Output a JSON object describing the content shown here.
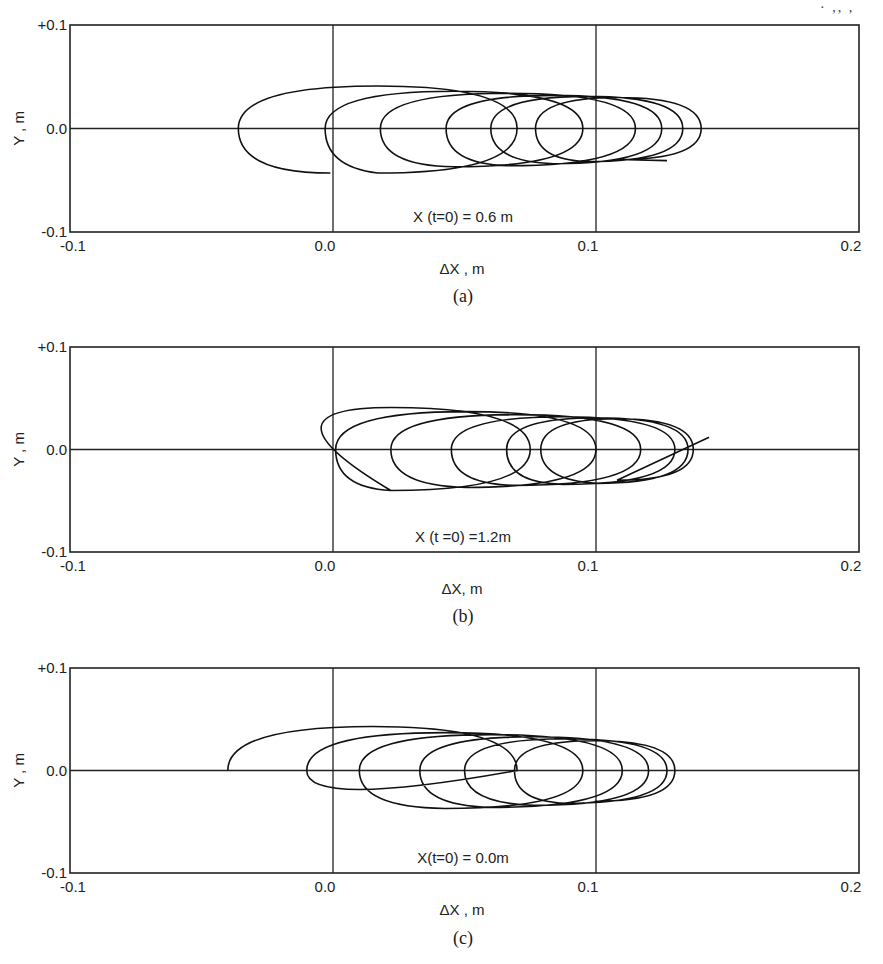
{
  "page": {
    "corner_mark": "· ,, ,"
  },
  "chart_data": [
    {
      "type": "line",
      "panel": "(a)",
      "caption": "(a)",
      "annotation": "X (t=0) = 0.6 m",
      "xlabel": "ΔX , m",
      "ylabel": "Y , m",
      "xlim": [
        -0.1,
        0.2
      ],
      "ylim": [
        -0.1,
        0.1
      ],
      "xticks": [
        "-0.1",
        "0.0",
        "0.1",
        "0.2"
      ],
      "yticks": [
        "+0.1",
        "0.0",
        "-0.1"
      ],
      "grid": "x at 0.0, 0.1; y at 0.0",
      "description": "Looping trajectory drifting in +ΔX; successive elliptical loops",
      "series": [
        {
          "name": "trajectory",
          "loops": [
            {
              "left_x": -0.036,
              "right_x": 0.07,
              "top_y": 0.041,
              "bottom_y": -0.043
            },
            {
              "left_x": -0.003,
              "right_x": 0.095,
              "top_y": 0.036,
              "bottom_y": -0.037
            },
            {
              "left_x": 0.018,
              "right_x": 0.115,
              "top_y": 0.034,
              "bottom_y": -0.036
            },
            {
              "left_x": 0.043,
              "right_x": 0.125,
              "top_y": 0.032,
              "bottom_y": -0.034
            },
            {
              "left_x": 0.06,
              "right_x": 0.133,
              "top_y": 0.031,
              "bottom_y": -0.032
            },
            {
              "left_x": 0.077,
              "right_x": 0.14,
              "top_y": 0.03,
              "bottom_y": -0.03
            }
          ],
          "start": [
            -0.001,
            -0.043
          ],
          "end": [
            0.127,
            -0.031
          ]
        }
      ]
    },
    {
      "type": "line",
      "panel": "(b)",
      "caption": "(b)",
      "annotation": "X (t =0) =1.2m",
      "xlabel": "ΔX, m",
      "ylabel": "Y , m",
      "xlim": [
        -0.1,
        0.2
      ],
      "ylim": [
        -0.1,
        0.1
      ],
      "xticks": [
        "-0.1",
        "0.0",
        "0.1",
        "0.2"
      ],
      "yticks": [
        "+0.1",
        "0.0",
        "-0.1"
      ],
      "grid": "x at 0.0, 0.1; y at 0.0",
      "description": "Looping trajectory drifting in +ΔX; successive elliptical loops",
      "series": [
        {
          "name": "trajectory",
          "loops": [
            {
              "left_x": -0.031,
              "right_x": 0.075,
              "top_y": 0.041,
              "bottom_y": -0.04
            },
            {
              "left_x": 0.001,
              "right_x": 0.1,
              "top_y": 0.037,
              "bottom_y": -0.037
            },
            {
              "left_x": 0.022,
              "right_x": 0.117,
              "top_y": 0.034,
              "bottom_y": -0.035
            },
            {
              "left_x": 0.045,
              "right_x": 0.13,
              "top_y": 0.032,
              "bottom_y": -0.034
            },
            {
              "left_x": 0.066,
              "right_x": 0.135,
              "top_y": 0.031,
              "bottom_y": -0.033
            },
            {
              "left_x": 0.079,
              "right_x": 0.137,
              "top_y": 0.03,
              "bottom_y": -0.03
            }
          ],
          "end": [
            0.143,
            0.012
          ]
        }
      ]
    },
    {
      "type": "line",
      "panel": "(c)",
      "caption": "(c)",
      "annotation": "X(t=0) = 0.0m",
      "xlabel": "ΔX , m",
      "ylabel": "Y , m",
      "xlim": [
        -0.1,
        0.2
      ],
      "ylim": [
        -0.1,
        0.1
      ],
      "xticks": [
        "-0.1",
        "0.0",
        "0.1",
        "0.2"
      ],
      "yticks": [
        "+0.1",
        "0.0",
        "-0.1"
      ],
      "grid": "x at 0.0, 0.1; y at 0.0",
      "description": "Looping trajectory drifting in +ΔX, starting on the axis at ΔX≈-0.04",
      "series": [
        {
          "name": "trajectory",
          "start": [
            -0.04,
            0.0
          ],
          "loops": [
            {
              "left_x": -0.04,
              "right_x": 0.07,
              "top_y": 0.043,
              "bottom_y": 0.0
            },
            {
              "left_x": -0.01,
              "right_x": 0.095,
              "top_y": 0.037,
              "bottom_y": -0.037
            },
            {
              "left_x": 0.01,
              "right_x": 0.11,
              "top_y": 0.035,
              "bottom_y": -0.036
            },
            {
              "left_x": 0.033,
              "right_x": 0.12,
              "top_y": 0.033,
              "bottom_y": -0.034
            },
            {
              "left_x": 0.05,
              "right_x": 0.127,
              "top_y": 0.031,
              "bottom_y": -0.032
            },
            {
              "left_x": 0.069,
              "right_x": 0.13,
              "top_y": 0.029,
              "bottom_y": -0.03
            }
          ]
        }
      ]
    }
  ]
}
